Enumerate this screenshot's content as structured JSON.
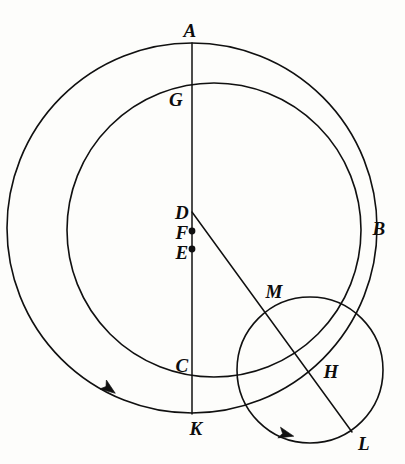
{
  "figure": {
    "background_color": "#fdfdfb",
    "ink_color": "#101010",
    "width": 405,
    "height": 464
  },
  "labels": {
    "A": "A",
    "G": "G",
    "B": "B",
    "D": "D",
    "F": "F",
    "E": "E",
    "M": "M",
    "C": "C",
    "H": "H",
    "K": "K",
    "L": "L"
  },
  "label_positions": {
    "A": {
      "x": 190,
      "y": 30
    },
    "G": {
      "x": 176,
      "y": 99
    },
    "B": {
      "x": 379,
      "y": 228
    },
    "D": {
      "x": 182,
      "y": 212
    },
    "F": {
      "x": 182,
      "y": 232
    },
    "E": {
      "x": 182,
      "y": 252
    },
    "M": {
      "x": 274,
      "y": 291
    },
    "C": {
      "x": 182,
      "y": 365
    },
    "H": {
      "x": 331,
      "y": 371
    },
    "K": {
      "x": 196,
      "y": 428
    },
    "L": {
      "x": 364,
      "y": 443
    }
  },
  "geometry": {
    "outer_circle": {
      "cx": 192,
      "cy": 228,
      "r": 185,
      "name": "deferent-outer-circle"
    },
    "inner_circle": {
      "cx": 214,
      "cy": 230,
      "r": 147,
      "name": "eccentric-inner-circle"
    },
    "small_circle": {
      "cx": 310,
      "cy": 370,
      "r": 73,
      "name": "epicycle-circle"
    },
    "vertical_line": {
      "x1": 192,
      "y1": 43,
      "x2": 192,
      "y2": 414,
      "name": "apsidal-line-AK"
    },
    "oblique_line": {
      "x1": 192,
      "y1": 212,
      "x2": 352,
      "y2": 432,
      "name": "radius-line-DL"
    },
    "dots": [
      {
        "x": 192,
        "y": 231,
        "name": "point-F-dot"
      },
      {
        "x": 192,
        "y": 249,
        "name": "point-E-dot"
      }
    ],
    "arrows": [
      {
        "x": 108,
        "y": 388,
        "angle": 36,
        "name": "outer-circle-direction-arrow"
      },
      {
        "x": 285,
        "y": 434,
        "angle": 14,
        "name": "epicycle-direction-arrow"
      }
    ]
  }
}
